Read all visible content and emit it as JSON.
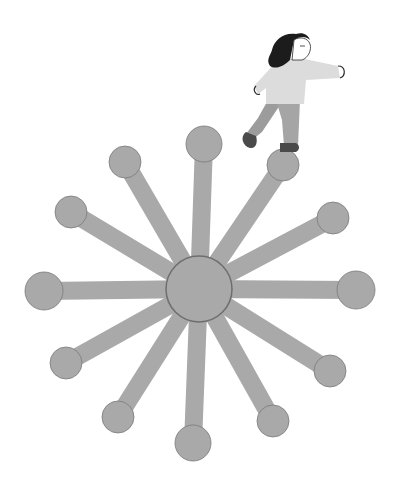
{
  "illustration": {
    "description": "Woman walking across a radial hub-and-spoke network",
    "colors": {
      "background": "#ffffff",
      "spoke": "#a9a9a9",
      "node": "#a9a9a9",
      "node_outline": "#7a7a7a",
      "hub_outline": "#6e6e6e",
      "hair": "#1c1c1c",
      "skin": "#ffffff",
      "sweater": "#dcdcdc",
      "pants": "#9c9c9c",
      "shoes": "#4a4a4a",
      "line": "#2a2a2a"
    },
    "hub": {
      "cx": 199,
      "cy": 289,
      "r": 33
    },
    "spoke_width": 18,
    "nodes": [
      {
        "cx": 204,
        "cy": 144,
        "r": 18
      },
      {
        "cx": 283,
        "cy": 165,
        "r": 16
      },
      {
        "cx": 333,
        "cy": 218,
        "r": 16
      },
      {
        "cx": 356,
        "cy": 290,
        "r": 19
      },
      {
        "cx": 330,
        "cy": 371,
        "r": 16
      },
      {
        "cx": 273,
        "cy": 421,
        "r": 16
      },
      {
        "cx": 193,
        "cy": 443,
        "r": 18
      },
      {
        "cx": 118,
        "cy": 417,
        "r": 16
      },
      {
        "cx": 66,
        "cy": 363,
        "r": 16
      },
      {
        "cx": 44,
        "cy": 291,
        "r": 19
      },
      {
        "cx": 71,
        "cy": 212,
        "r": 16
      },
      {
        "cx": 125,
        "cy": 162,
        "r": 16
      }
    ]
  }
}
